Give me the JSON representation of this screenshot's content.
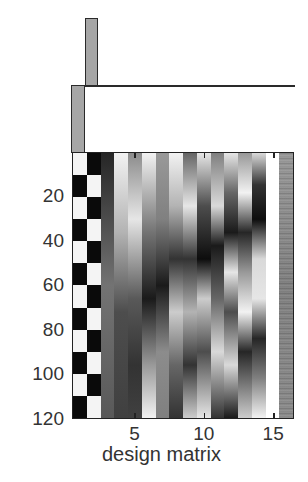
{
  "figure": {
    "xlabel": "design matrix",
    "x_ticks": [
      {
        "label": "5",
        "col": 5
      },
      {
        "label": "10",
        "col": 10
      },
      {
        "label": "15",
        "col": 15
      }
    ],
    "y_ticks": [
      {
        "label": "20",
        "row": 20
      },
      {
        "label": "40",
        "row": 40
      },
      {
        "label": "60",
        "row": 60
      },
      {
        "label": "80",
        "row": 80
      },
      {
        "label": "100",
        "row": 100
      },
      {
        "label": "120",
        "row": 120
      }
    ],
    "n_rows": 120,
    "n_cols": 16
  },
  "contrasts": [
    {
      "name": "contrast-1",
      "weights": [
        0,
        1,
        0,
        0,
        0,
        0,
        0,
        0,
        0,
        0,
        0,
        0,
        0,
        0,
        0,
        0
      ]
    },
    {
      "name": "contrast-2",
      "weights": [
        1,
        0,
        0,
        0,
        0,
        0,
        0,
        0,
        0,
        0,
        0,
        0,
        0,
        0,
        0,
        0
      ]
    }
  ],
  "colors": {
    "bar_fill": "#a6a6a6",
    "axis": "#222222",
    "text": "#333333"
  },
  "chart_data": {
    "type": "heatmap",
    "title": "",
    "xlabel": "design matrix",
    "ylabel": "",
    "x_range": [
      0.5,
      16.5
    ],
    "y_range": [
      0.5,
      120.5
    ],
    "x_tick_labels": [
      "5",
      "10",
      "15"
    ],
    "y_tick_labels": [
      "20",
      "40",
      "60",
      "80",
      "100",
      "120"
    ],
    "colormap": "gray",
    "columns": [
      {
        "index": 1,
        "description": "boxcar condition A (blocks of 10 scans, starts on)",
        "block_length": 10,
        "phase": 0
      },
      {
        "index": 2,
        "description": "boxcar condition B (blocks of 10 scans, starts off)",
        "block_length": 10,
        "phase": 1
      },
      {
        "index": 3,
        "description": "slow drift regressor",
        "stops": [
          [
            0,
            0.15
          ],
          [
            0.5,
            0.45
          ],
          [
            1,
            0.35
          ]
        ]
      },
      {
        "index": 4,
        "description": "slow drift regressor",
        "stops": [
          [
            0,
            0.95
          ],
          [
            0.3,
            0.7
          ],
          [
            0.6,
            0.3
          ],
          [
            1,
            0.25
          ]
        ]
      },
      {
        "index": 5,
        "description": "slow drift regressor",
        "stops": [
          [
            0,
            0.55
          ],
          [
            0.25,
            0.9
          ],
          [
            0.55,
            0.35
          ],
          [
            0.8,
            0.2
          ],
          [
            1,
            0.25
          ]
        ]
      },
      {
        "index": 6,
        "description": "cosine basis",
        "stops": [
          [
            0,
            0.95
          ],
          [
            0.3,
            0.45
          ],
          [
            0.55,
            0.1
          ],
          [
            0.8,
            0.6
          ],
          [
            1,
            0.95
          ]
        ]
      },
      {
        "index": 7,
        "description": "cosine basis",
        "stops": [
          [
            0,
            0.6
          ],
          [
            0.25,
            0.5
          ],
          [
            0.5,
            0.1
          ],
          [
            0.75,
            0.55
          ],
          [
            1,
            0.5
          ]
        ]
      },
      {
        "index": 8,
        "description": "cosine basis",
        "stops": [
          [
            0,
            0.95
          ],
          [
            0.2,
            0.7
          ],
          [
            0.4,
            0.2
          ],
          [
            0.6,
            0.8
          ],
          [
            0.8,
            0.4
          ],
          [
            1,
            0.2
          ]
        ]
      },
      {
        "index": 9,
        "description": "cosine basis",
        "stops": [
          [
            0,
            0.4
          ],
          [
            0.2,
            0.9
          ],
          [
            0.4,
            0.2
          ],
          [
            0.6,
            0.7
          ],
          [
            0.8,
            0.2
          ],
          [
            1,
            0.8
          ]
        ]
      },
      {
        "index": 10,
        "description": "cosine basis",
        "stops": [
          [
            0,
            0.9
          ],
          [
            0.2,
            0.3
          ],
          [
            0.4,
            0.05
          ],
          [
            0.55,
            0.8
          ],
          [
            0.75,
            0.3
          ],
          [
            1,
            0.9
          ]
        ]
      },
      {
        "index": 11,
        "description": "cosine basis",
        "stops": [
          [
            0,
            0.5
          ],
          [
            0.2,
            0.85
          ],
          [
            0.35,
            0.1
          ],
          [
            0.55,
            0.4
          ],
          [
            0.75,
            0.85
          ],
          [
            1,
            0.2
          ]
        ]
      },
      {
        "index": 12,
        "description": "cosine basis",
        "stops": [
          [
            0,
            0.9
          ],
          [
            0.15,
            0.4
          ],
          [
            0.3,
            0.1
          ],
          [
            0.45,
            0.9
          ],
          [
            0.6,
            0.3
          ],
          [
            0.8,
            0.85
          ],
          [
            1,
            0.1
          ]
        ]
      },
      {
        "index": 13,
        "description": "cosine basis",
        "stops": [
          [
            0,
            0.6
          ],
          [
            0.15,
            0.95
          ],
          [
            0.3,
            0.15
          ],
          [
            0.45,
            0.6
          ],
          [
            0.6,
            0.95
          ],
          [
            0.75,
            0.15
          ],
          [
            1,
            0.8
          ]
        ]
      },
      {
        "index": 14,
        "description": "cosine basis",
        "stops": [
          [
            0,
            0.85
          ],
          [
            0.12,
            0.2
          ],
          [
            0.25,
            0.05
          ],
          [
            0.4,
            0.85
          ],
          [
            0.55,
            0.9
          ],
          [
            0.7,
            0.15
          ],
          [
            0.85,
            0.5
          ],
          [
            1,
            0.95
          ]
        ]
      },
      {
        "index": 15,
        "description": "constant term",
        "stops": [
          [
            0,
            1.0
          ],
          [
            1,
            1.0
          ]
        ]
      },
      {
        "index": 16,
        "description": "noisy covariate",
        "stops": [
          [
            0,
            0.6
          ],
          [
            0.5,
            0.5
          ],
          [
            1,
            0.55
          ]
        ],
        "noise": true
      }
    ]
  }
}
